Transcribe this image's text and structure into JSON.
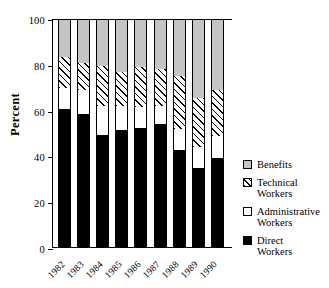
{
  "chart": {
    "ylabel": "Percent",
    "ytick_labels": [
      "0",
      "20",
      "40",
      "60",
      "80",
      "100"
    ]
  },
  "legend": {
    "items": [
      {
        "label": "Benefits",
        "swatch": "benefits-swatch"
      },
      {
        "label": "Technical\nWorkers",
        "swatch": "technical-workers-swatch"
      },
      {
        "label": "Administrative\nWorkers",
        "swatch": "administrative-workers-swatch"
      },
      {
        "label": "Direct\nWorkers",
        "swatch": "direct-workers-swatch"
      }
    ]
  },
  "chart_data": {
    "type": "bar",
    "title": "",
    "subtitle": "",
    "xlabel": "",
    "ylabel": "Percent",
    "ylim": [
      0,
      100
    ],
    "yticks": [
      0,
      20,
      40,
      60,
      80,
      100
    ],
    "grid": false,
    "stacked": true,
    "legend_position": "right",
    "categories": [
      "1982",
      "1983",
      "1984",
      "1985",
      "1986",
      "1987",
      "1988",
      "1989",
      "1990"
    ],
    "series": [
      {
        "name": "Direct Workers",
        "color": "#000000",
        "values": [
          60.5,
          58.5,
          49.5,
          51.5,
          52.5,
          54.0,
          43.0,
          35.0,
          39.5
        ]
      },
      {
        "name": "Administrative Workers",
        "color": "#ffffff",
        "values": [
          9.5,
          10.5,
          12.5,
          10.5,
          9.0,
          8.0,
          9.0,
          9.0,
          9.5
        ]
      },
      {
        "name": "Technical Workers",
        "color": "hatch-45deg",
        "values": [
          13.5,
          12.0,
          17.5,
          15.0,
          17.5,
          16.0,
          23.0,
          21.5,
          20.0
        ]
      },
      {
        "name": "Benefits",
        "color": "#c4c4c4",
        "values": [
          16.5,
          19.0,
          20.5,
          23.0,
          21.0,
          22.0,
          25.0,
          34.5,
          31.0
        ]
      }
    ]
  }
}
